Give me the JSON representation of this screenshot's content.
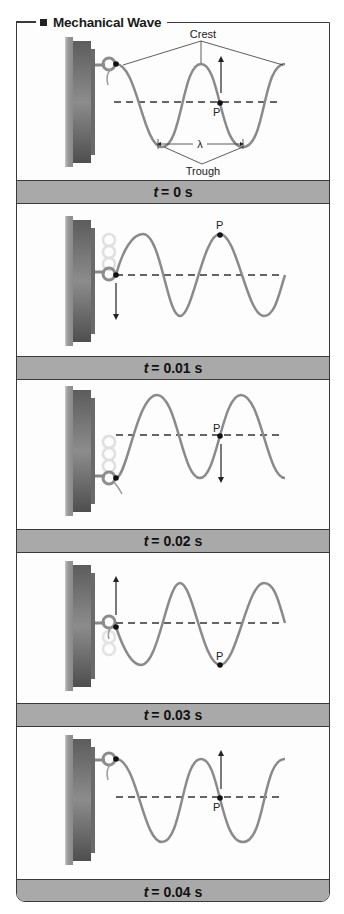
{
  "title": "Mechanical Wave",
  "labels": {
    "crest": "Crest",
    "trough": "Trough",
    "wavelength": "λ",
    "point": "P"
  },
  "panels": [
    {
      "time_var": "t",
      "time_value": "= 0 s",
      "point_P_state": "equilibrium",
      "P_arrow": "up",
      "source_position": "top"
    },
    {
      "time_var": "t",
      "time_value": "= 0.01 s",
      "point_P_state": "crest",
      "P_arrow": "none",
      "source_position": "middle",
      "source_arrow": "down"
    },
    {
      "time_var": "t",
      "time_value": "= 0.02 s",
      "point_P_state": "equilibrium",
      "P_arrow": "down",
      "source_position": "bottom"
    },
    {
      "time_var": "t",
      "time_value": "= 0.03 s",
      "point_P_state": "trough",
      "P_arrow": "none",
      "source_position": "middle",
      "source_arrow": "up"
    },
    {
      "time_var": "t",
      "time_value": "= 0.04 s",
      "point_P_state": "equilibrium",
      "P_arrow": "up",
      "source_position": "top"
    }
  ],
  "colors": {
    "wave": "#8a8a8a",
    "bar": "#a9a9a9",
    "border": "#3a3a3a",
    "wall": "#6e6e6e"
  }
}
